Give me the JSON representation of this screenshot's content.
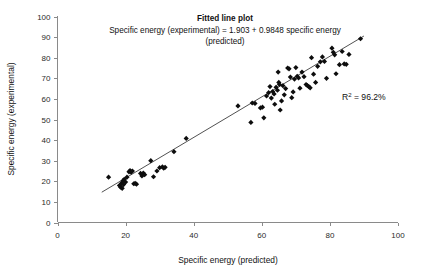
{
  "chart_data": {
    "type": "scatter",
    "title": "Fitted line plot",
    "subtitle": "Specific energy (experimental) = 1.903 + 0.9848 specific energy (predicted)",
    "subtitle_line1": "Specific energy (experimental) = 1.903 + 0.9848 specific energy",
    "subtitle_line2": "(predicted)",
    "xlabel": "Specific energy (predicted)",
    "ylabel": "Specific energy (experimental)",
    "xlim": [
      0,
      100
    ],
    "ylim": [
      0,
      100
    ],
    "xticks": [
      0,
      20,
      40,
      60,
      80,
      100
    ],
    "yticks": [
      0,
      10,
      20,
      30,
      40,
      50,
      60,
      70,
      80,
      90,
      100
    ],
    "grid": false,
    "legend": "none",
    "marker": "diamond",
    "marker_color": "#0d0d0d",
    "line_color": "#3d3d3d",
    "fit": {
      "intercept": 1.903,
      "slope": 0.9848,
      "x_start": 13.0,
      "x_end": 90.0
    },
    "annotations": [
      {
        "name": "r-squared",
        "text": "R2 = 96.2%",
        "base": "R",
        "sup": "2",
        "rest": " = 96.2%",
        "x": 88,
        "y": 61
      }
    ],
    "points": [
      [
        15.0,
        22.0
      ],
      [
        18.2,
        18.0
      ],
      [
        18.5,
        17.2
      ],
      [
        18.8,
        19.0
      ],
      [
        19.0,
        16.6
      ],
      [
        19.2,
        20.2
      ],
      [
        19.4,
        18.4
      ],
      [
        19.6,
        21.0
      ],
      [
        20.0,
        19.6
      ],
      [
        20.4,
        22.0
      ],
      [
        21.0,
        24.6
      ],
      [
        21.3,
        25.2
      ],
      [
        21.6,
        24.4
      ],
      [
        22.0,
        25.0
      ],
      [
        22.4,
        18.8
      ],
      [
        22.8,
        19.0
      ],
      [
        23.2,
        18.6
      ],
      [
        24.4,
        23.8
      ],
      [
        24.8,
        22.6
      ],
      [
        25.2,
        24.0
      ],
      [
        25.6,
        23.2
      ],
      [
        27.4,
        30.0
      ],
      [
        28.2,
        22.2
      ],
      [
        29.2,
        25.0
      ],
      [
        30.0,
        26.6
      ],
      [
        30.8,
        27.0
      ],
      [
        31.2,
        26.4
      ],
      [
        31.6,
        26.8
      ],
      [
        34.2,
        34.4
      ],
      [
        37.8,
        40.8
      ],
      [
        53.0,
        56.6
      ],
      [
        56.8,
        48.6
      ],
      [
        57.2,
        58.0
      ],
      [
        58.0,
        57.8
      ],
      [
        59.6,
        55.6
      ],
      [
        60.2,
        56.0
      ],
      [
        60.6,
        50.8
      ],
      [
        61.4,
        61.4
      ],
      [
        62.0,
        63.0
      ],
      [
        62.4,
        66.0
      ],
      [
        62.8,
        60.4
      ],
      [
        63.2,
        63.6
      ],
      [
        63.6,
        62.4
      ],
      [
        63.8,
        57.4
      ],
      [
        64.2,
        65.6
      ],
      [
        64.6,
        64.2
      ],
      [
        64.8,
        73.0
      ],
      [
        65.0,
        68.0
      ],
      [
        65.2,
        67.0
      ],
      [
        65.4,
        54.6
      ],
      [
        65.8,
        59.0
      ],
      [
        66.2,
        66.4
      ],
      [
        66.6,
        62.0
      ],
      [
        67.0,
        65.0
      ],
      [
        67.6,
        75.0
      ],
      [
        68.0,
        74.6
      ],
      [
        68.4,
        70.6
      ],
      [
        68.8,
        60.6
      ],
      [
        69.2,
        63.4
      ],
      [
        69.6,
        69.6
      ],
      [
        70.0,
        75.2
      ],
      [
        70.4,
        71.0
      ],
      [
        70.8,
        70.2
      ],
      [
        71.2,
        65.2
      ],
      [
        71.8,
        73.0
      ],
      [
        72.4,
        70.8
      ],
      [
        73.0,
        67.0
      ],
      [
        73.4,
        66.4
      ],
      [
        73.8,
        66.0
      ],
      [
        74.2,
        65.4
      ],
      [
        74.6,
        80.0
      ],
      [
        75.2,
        72.0
      ],
      [
        75.8,
        68.0
      ],
      [
        76.4,
        75.8
      ],
      [
        77.2,
        78.0
      ],
      [
        77.8,
        80.4
      ],
      [
        78.4,
        78.2
      ],
      [
        79.0,
        70.0
      ],
      [
        80.6,
        84.6
      ],
      [
        81.0,
        82.6
      ],
      [
        81.4,
        81.4
      ],
      [
        81.8,
        72.2
      ],
      [
        82.8,
        76.6
      ],
      [
        83.6,
        83.0
      ],
      [
        84.2,
        77.0
      ],
      [
        84.8,
        76.8
      ],
      [
        85.6,
        81.6
      ],
      [
        89.0,
        89.2
      ]
    ]
  }
}
